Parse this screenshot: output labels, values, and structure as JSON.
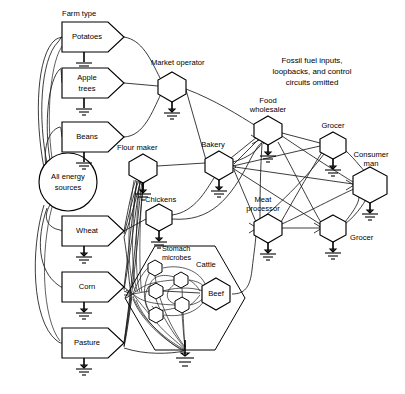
{
  "diagram": {
    "title_note": "Fossil fuel inputs, loopbacks, and control circuits omitted",
    "note_lines": [
      "Fossil fuel inputs,",
      "loopbacks, and  control",
      "circuits omitted"
    ],
    "section_label": "Farm type",
    "source_node": {
      "name": "all-energy-sources",
      "label_lines": [
        "All energy",
        "sources"
      ],
      "shape": "circle",
      "cx": 68,
      "cy": 182,
      "r": 29
    },
    "farm_boxes": [
      {
        "name": "potatoes",
        "label": "Potatoes",
        "x": 62,
        "y": 22,
        "w": 56,
        "h": 30
      },
      {
        "name": "apple-trees",
        "label_lines": [
          "Apple",
          "trees"
        ],
        "label": "Apple trees",
        "x": 62,
        "y": 68,
        "w": 56,
        "h": 30
      },
      {
        "name": "beans",
        "label": "Beans",
        "x": 62,
        "y": 122,
        "w": 56,
        "h": 30
      },
      {
        "name": "wheat",
        "label": "Wheat",
        "x": 62,
        "y": 216,
        "w": 56,
        "h": 30
      },
      {
        "name": "corn",
        "label": "Corn",
        "x": 62,
        "y": 272,
        "w": 56,
        "h": 30
      },
      {
        "name": "pasture",
        "label": "Pasture",
        "x": 62,
        "y": 328,
        "w": 56,
        "h": 30
      }
    ],
    "hex_nodes": [
      {
        "name": "market-operator",
        "label": "Market operator",
        "cx": 172,
        "cy": 86,
        "r": 14,
        "label_x": 151,
        "label_y": 66,
        "anchor": "start"
      },
      {
        "name": "flour-maker",
        "label": "Flour maker",
        "cx": 143,
        "cy": 168,
        "r": 14,
        "label_x": 117,
        "label_y": 152,
        "anchor": "start"
      },
      {
        "name": "chickens",
        "label": "Chickens",
        "cx": 159,
        "cy": 217,
        "r": 13,
        "label_x": 144,
        "label_y": 200,
        "anchor": "start"
      },
      {
        "name": "bakery",
        "label": "Bakery",
        "cx": 219,
        "cy": 165,
        "r": 14,
        "label_x": 210,
        "label_y": 147,
        "anchor": "middle"
      },
      {
        "name": "food-wholesaler",
        "label_lines": [
          "Food",
          "wholesaler"
        ],
        "label": "Food wholesaler",
        "cx": 268,
        "cy": 130,
        "r": 14,
        "label_x": 268,
        "label_y": 104,
        "anchor": "middle"
      },
      {
        "name": "grocer-upper",
        "label": "Grocer",
        "cx": 333,
        "cy": 145,
        "r": 13,
        "label_x": 333,
        "label_y": 128,
        "anchor": "middle"
      },
      {
        "name": "consumer-man",
        "label_lines": [
          "Consumer",
          "man"
        ],
        "label": "Consumer man",
        "cx": 370,
        "cy": 185,
        "r": 17,
        "label_x": 370,
        "label_y": 158,
        "anchor": "middle"
      },
      {
        "name": "meat-processor",
        "label_lines": [
          "Meat",
          "processor"
        ],
        "label": "Meat processor",
        "cx": 268,
        "cy": 228,
        "r": 14,
        "label_x": 268,
        "label_y": 210,
        "anchor": "middle"
      },
      {
        "name": "grocer-lower",
        "label": "Grocer",
        "cx": 333,
        "cy": 228,
        "r": 13,
        "label_x": 349,
        "label_y": 239,
        "anchor": "start"
      },
      {
        "name": "beef",
        "label": "Beef",
        "cx": 216,
        "cy": 294,
        "r": 16,
        "label_x": 216,
        "label_y": 294,
        "anchor": "middle"
      }
    ],
    "cattle_group": {
      "name": "cattle",
      "label": "Cattle",
      "label_x": 196,
      "label_y": 265,
      "outer_hex": {
        "cx": 185,
        "cy": 298,
        "r": 60
      },
      "microbes_label_lines": [
        "Stomach",
        "microbes"
      ],
      "microbes_label": "Stomach microbes",
      "microbes_label_x": 162,
      "microbes_label_y": 252,
      "microbes": [
        {
          "name": "stomach-microbe-1",
          "cx": 155,
          "cy": 268,
          "r": 8
        },
        {
          "name": "stomach-microbe-2",
          "cx": 181,
          "cy": 280,
          "r": 8
        },
        {
          "name": "stomach-microbe-3",
          "cx": 156,
          "cy": 291,
          "r": 8
        },
        {
          "name": "stomach-microbe-4",
          "cx": 182,
          "cy": 305,
          "r": 8
        },
        {
          "name": "stomach-microbe-5",
          "cx": 156,
          "cy": 315,
          "r": 8
        }
      ]
    },
    "grounds": [
      {
        "name": "ground-potatoes",
        "x": 71,
        "y": 52,
        "len": 10
      },
      {
        "name": "ground-apple-trees",
        "x": 71,
        "y": 98,
        "len": 10
      },
      {
        "name": "ground-beans",
        "x": 71,
        "y": 152,
        "len": 10
      },
      {
        "name": "ground-wheat",
        "x": 71,
        "y": 246,
        "len": 10
      },
      {
        "name": "ground-corn",
        "x": 71,
        "y": 302,
        "len": 10
      },
      {
        "name": "ground-pasture",
        "x": 71,
        "y": 358,
        "len": 10
      },
      {
        "name": "ground-market-operator",
        "x": 172,
        "y": 100,
        "len": 9
      },
      {
        "name": "ground-flour-maker",
        "x": 143,
        "y": 182,
        "len": 9
      },
      {
        "name": "ground-chickens",
        "x": 159,
        "y": 230,
        "len": 9
      },
      {
        "name": "ground-bakery",
        "x": 219,
        "y": 179,
        "len": 9
      },
      {
        "name": "ground-food-wholesaler",
        "x": 268,
        "y": 144,
        "len": 9
      },
      {
        "name": "ground-grocer-upper",
        "x": 333,
        "y": 158,
        "len": 9
      },
      {
        "name": "ground-consumer-man",
        "x": 370,
        "y": 202,
        "len": 9
      },
      {
        "name": "ground-meat-processor",
        "x": 268,
        "y": 242,
        "len": 9
      },
      {
        "name": "ground-grocer-lower",
        "x": 333,
        "y": 241,
        "len": 9
      },
      {
        "name": "ground-cattle",
        "x": 185,
        "y": 352,
        "len": 9
      }
    ]
  }
}
